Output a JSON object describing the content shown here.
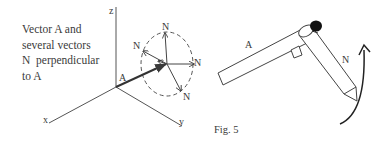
{
  "left_diagram": {
    "caption_lines": [
      "Vector A and",
      "several vectors",
      "N  perpendicular",
      "to A"
    ],
    "axis_labels": {
      "x": "x",
      "y": "y",
      "z": "z"
    },
    "vector_a_label": "A",
    "normal_labels": [
      "N",
      "N",
      "N",
      "N"
    ]
  },
  "right_diagram": {
    "rod_label": "A",
    "pencil_label": "N"
  },
  "figure_label": "Fig. 5",
  "colors": {
    "ink": "#3a3a3a",
    "background": "#ffffff"
  }
}
